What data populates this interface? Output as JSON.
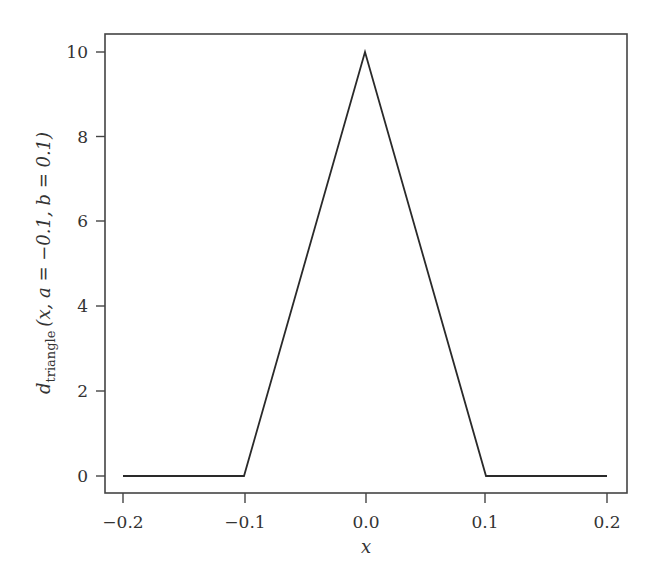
{
  "chart_data": {
    "type": "line",
    "title": "",
    "xlabel": "x",
    "ylabel": "d_triangle(x, a = -0.1, b = 0.1)",
    "ylabel_parts": {
      "main": "d",
      "subscript": "triangle",
      "args": "(x, a = −0.1, b = 0.1)"
    },
    "xlim": [
      -0.22,
      0.22
    ],
    "ylim": [
      -0.4,
      10.4
    ],
    "x_ticks": [
      -0.2,
      -0.1,
      0.0,
      0.1,
      0.2
    ],
    "x_tick_labels": [
      "−0.2",
      "−0.1",
      "0.0",
      "0.1",
      "0.2"
    ],
    "y_ticks": [
      0,
      2,
      4,
      6,
      8,
      10
    ],
    "y_tick_labels": [
      "0",
      "2",
      "4",
      "6",
      "8",
      "10"
    ],
    "grid": false,
    "legend": null,
    "series": [
      {
        "name": "triangle density",
        "x": [
          -0.2,
          -0.1,
          0.0,
          0.1,
          0.2
        ],
        "y": [
          0,
          0,
          10,
          0,
          0
        ],
        "color": "#2a2a2a"
      }
    ]
  }
}
